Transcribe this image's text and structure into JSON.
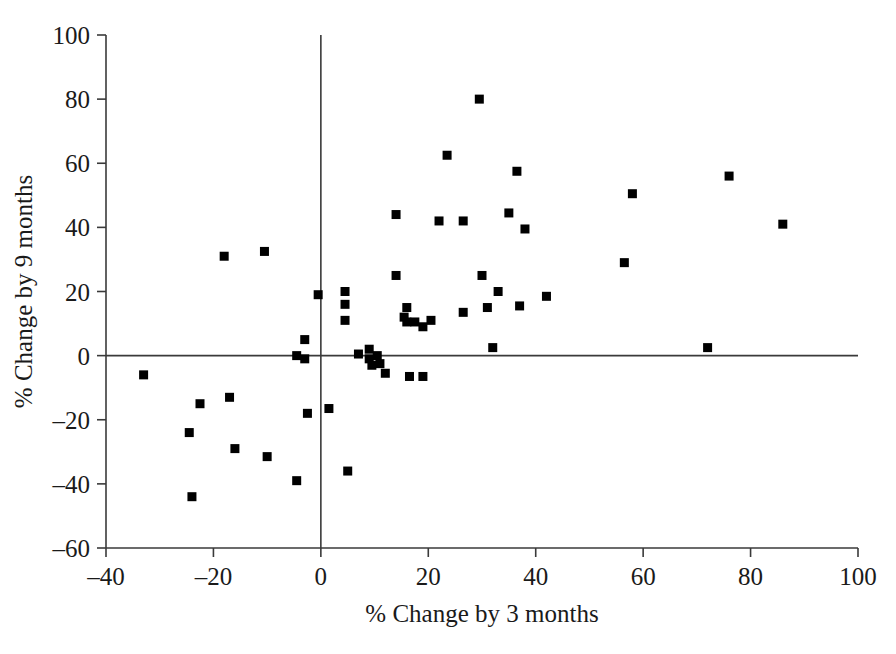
{
  "chart_data": {
    "type": "scatter",
    "title": "",
    "xlabel": "% Change by 3 months",
    "ylabel": "% Change by 9 months",
    "xlim": [
      -40,
      100
    ],
    "ylim": [
      -60,
      100
    ],
    "xticks": [
      -40,
      -20,
      0,
      20,
      40,
      60,
      80,
      100
    ],
    "yticks": [
      -60,
      -40,
      -20,
      0,
      20,
      40,
      60,
      80,
      100
    ],
    "xtick_labels": [
      "–40",
      "–20",
      "0",
      "20",
      "40",
      "60",
      "80",
      "100"
    ],
    "ytick_labels": [
      "–60",
      "–40",
      "–20",
      "0",
      "20",
      "40",
      "60",
      "80",
      "100"
    ],
    "grid": false,
    "legend": "none",
    "marker": "square",
    "marker_color": "#000000",
    "marker_size": 9,
    "reference_lines": [
      {
        "orientation": "vertical",
        "value": 0
      },
      {
        "orientation": "horizontal",
        "value": 0
      }
    ],
    "n_points": 56,
    "points": [
      {
        "x": -33,
        "y": -6
      },
      {
        "x": -24.5,
        "y": -24
      },
      {
        "x": -24,
        "y": -44
      },
      {
        "x": -22.5,
        "y": -15
      },
      {
        "x": -18,
        "y": 31
      },
      {
        "x": -17,
        "y": -13
      },
      {
        "x": -16,
        "y": -29
      },
      {
        "x": -10.5,
        "y": 32.5
      },
      {
        "x": -10,
        "y": -31.5
      },
      {
        "x": -4.5,
        "y": -39
      },
      {
        "x": -4.5,
        "y": 0
      },
      {
        "x": -3,
        "y": 5
      },
      {
        "x": -3,
        "y": -1
      },
      {
        "x": -2.5,
        "y": -18
      },
      {
        "x": -0.5,
        "y": 19
      },
      {
        "x": 1.5,
        "y": -16.5
      },
      {
        "x": 4.5,
        "y": 20
      },
      {
        "x": 4.5,
        "y": 16
      },
      {
        "x": 4.5,
        "y": 11
      },
      {
        "x": 5,
        "y": -36
      },
      {
        "x": 7,
        "y": 0.5
      },
      {
        "x": 9,
        "y": 2
      },
      {
        "x": 9,
        "y": -1
      },
      {
        "x": 9.5,
        "y": -3
      },
      {
        "x": 10.5,
        "y": 0
      },
      {
        "x": 11,
        "y": -2.5
      },
      {
        "x": 12,
        "y": -5.5
      },
      {
        "x": 14,
        "y": 25
      },
      {
        "x": 15.5,
        "y": 12
      },
      {
        "x": 16,
        "y": 15
      },
      {
        "x": 16,
        "y": 10.5
      },
      {
        "x": 16.5,
        "y": -6.5
      },
      {
        "x": 17.5,
        "y": 10.5
      },
      {
        "x": 19,
        "y": 9
      },
      {
        "x": 19,
        "y": -6.5
      },
      {
        "x": 22,
        "y": 42
      },
      {
        "x": 23.5,
        "y": 62.5
      },
      {
        "x": 26.5,
        "y": 13.5
      },
      {
        "x": 29.5,
        "y": 80
      },
      {
        "x": 30,
        "y": 25
      },
      {
        "x": 31,
        "y": 15
      },
      {
        "x": 32,
        "y": 2.5
      },
      {
        "x": 33,
        "y": 20
      },
      {
        "x": 35,
        "y": 44.5
      },
      {
        "x": 36.5,
        "y": 57.5
      },
      {
        "x": 37,
        "y": 15.5
      },
      {
        "x": 38,
        "y": 39.5
      },
      {
        "x": 42,
        "y": 18.5
      },
      {
        "x": 56.5,
        "y": 29
      },
      {
        "x": 58,
        "y": 50.5
      },
      {
        "x": 72,
        "y": 2.5
      },
      {
        "x": 76,
        "y": 56
      },
      {
        "x": 86,
        "y": 41
      },
      {
        "x": 14,
        "y": 44
      },
      {
        "x": 20.5,
        "y": 11
      },
      {
        "x": 26.5,
        "y": 42
      }
    ]
  },
  "figure": {
    "background_color": "#ffffff",
    "axis_color": "#3a3a3a"
  }
}
